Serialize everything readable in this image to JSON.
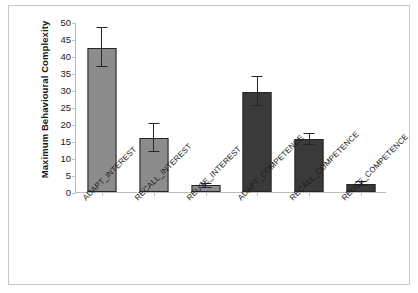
{
  "chart_data": {
    "type": "bar",
    "title": "",
    "xlabel": "",
    "ylabel": "Maximum Behavioural Complexity",
    "ylim": [
      0,
      50
    ],
    "ytick_step": 5,
    "yticks": [
      "50",
      "45",
      "40",
      "35",
      "30",
      "25",
      "20",
      "15",
      "10",
      "5",
      "0"
    ],
    "grid": false,
    "legend": "none",
    "categories": [
      "ADAPT_INTEREST",
      "RECALL_INTEREST",
      "REUSE_INTEREST",
      "ADAPT_COMPETENCE",
      "RECALL_COMPETENCE",
      "REUSE_COMPETENCE"
    ],
    "values": [
      42.5,
      16.0,
      2.0,
      29.3,
      15.7,
      2.5
    ],
    "error_low": [
      36.8,
      11.8,
      1.3,
      25.4,
      13.9,
      1.7
    ],
    "error_high": [
      48.6,
      20.3,
      2.7,
      34.0,
      17.5,
      3.3
    ],
    "series_colors": [
      "#8c8c8c",
      "#3a3a3a"
    ],
    "bar_colors": [
      "#8c8c8c",
      "#8c8c8c",
      "#8c8c8c",
      "#3a3a3a",
      "#3a3a3a",
      "#3a3a3a"
    ],
    "bar_border_color": "#262626",
    "axis_color": "#bdbdbd",
    "frame_color": "#c8c8c8",
    "background": "#ffffff"
  }
}
